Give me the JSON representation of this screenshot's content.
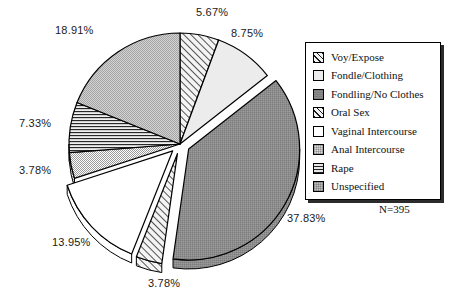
{
  "chart_data": {
    "type": "pie",
    "title": "",
    "subtitle": "",
    "xlabel": "",
    "ylabel": "",
    "legend_position": "right",
    "grid": false,
    "total_label": "N=395",
    "total": 395,
    "start_angle_deg": 0,
    "categories": [
      "Voy/Expose",
      "Fondle/Clothing",
      "Fondling/No Clothes",
      "Oral Sex",
      "Vaginal Intercourse",
      "Anal Intercourse",
      "Rape",
      "Unspecified"
    ],
    "values": [
      5.67,
      8.75,
      37.83,
      3.78,
      13.95,
      3.78,
      7.33,
      18.91
    ],
    "value_labels": [
      "5.67%",
      "8.75%",
      "37.83%",
      "3.78%",
      "13.95%",
      "3.78%",
      "7.33%",
      "18.91%"
    ],
    "slices": [
      {
        "label": "Voy/Expose",
        "value": 5.67,
        "value_label": "5.67%",
        "pattern": "diagonal-hatch",
        "fill_class": "fill-hatch",
        "exploded": false
      },
      {
        "label": "Fondle/Clothing",
        "value": 8.75,
        "value_label": "8.75%",
        "pattern": "very-light-solid",
        "fill_class": "fill-verylight",
        "exploded": false
      },
      {
        "label": "Fondling/No Clothes",
        "value": 37.83,
        "value_label": "37.83%",
        "pattern": "dark-gray",
        "fill_class": "fill-darkgray",
        "exploded": true
      },
      {
        "label": "Oral Sex",
        "value": 3.78,
        "value_label": "3.78%",
        "pattern": "diagonal-hatch",
        "fill_class": "fill-hatch",
        "exploded": true
      },
      {
        "label": "Vaginal Intercourse",
        "value": 13.95,
        "value_label": "13.95%",
        "pattern": "white",
        "fill_class": "fill-white",
        "exploded": true
      },
      {
        "label": "Anal Intercourse",
        "value": 3.78,
        "value_label": "3.78%",
        "pattern": "light-dotted",
        "fill_class": "fill-lightdot",
        "exploded": false
      },
      {
        "label": "Rape",
        "value": 7.33,
        "value_label": "7.33%",
        "pattern": "horizontal-lines",
        "fill_class": "fill-hlines",
        "exploded": false
      },
      {
        "label": "Unspecified",
        "value": 18.91,
        "value_label": "18.91%",
        "pattern": "medium-dotted",
        "fill_class": "fill-meddot",
        "exploded": false
      }
    ],
    "colors": {
      "outline": "#000000",
      "very_light": "#ececec",
      "light_dotted": "#d9d9d9",
      "medium_dotted": "#bdbdbd",
      "dark_gray": "#8a8a8a",
      "white": "#ffffff",
      "background": "#ffffff"
    }
  },
  "labels": {
    "p_voy": "5.67%",
    "p_fondle_clothing": "8.75%",
    "p_fondling_no_clothes": "37.83%",
    "p_oral_sex": "3.78%",
    "p_vaginal": "13.95%",
    "p_anal": "3.78%",
    "p_rape": "7.33%",
    "p_unspecified": "18.91%"
  },
  "legend": {
    "items": [
      {
        "label": "Voy/Expose"
      },
      {
        "label": "Fondle/Clothing"
      },
      {
        "label": "Fondling/No Clothes"
      },
      {
        "label": "Oral Sex"
      },
      {
        "label": "Vaginal Intercourse"
      },
      {
        "label": "Anal Intercourse"
      },
      {
        "label": "Rape"
      },
      {
        "label": "Unspecified"
      }
    ]
  },
  "footer": {
    "n_label": "N=395"
  }
}
